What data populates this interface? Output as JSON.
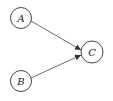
{
  "diagram": {
    "nodes": [
      {
        "id": "A",
        "label": "A"
      },
      {
        "id": "B",
        "label": "B"
      },
      {
        "id": "C",
        "label": "C"
      }
    ],
    "edges": [
      {
        "from": "A",
        "to": "C"
      },
      {
        "from": "B",
        "to": "C"
      }
    ]
  }
}
